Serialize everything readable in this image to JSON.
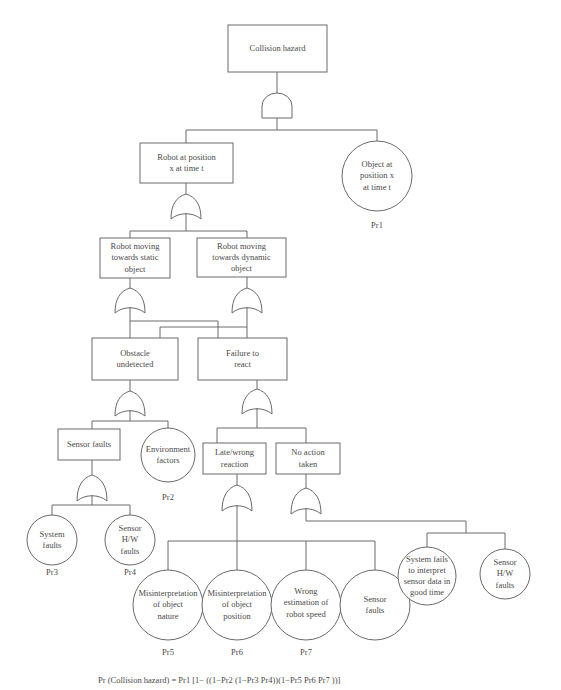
{
  "diagram": {
    "type": "fault-tree",
    "top_event": {
      "label": "Collision hazard",
      "gate": "AND"
    },
    "nodes": {
      "collision_hazard": "Collision hazard",
      "robot_at_position": [
        "Robot at position",
        "x at time t"
      ],
      "object_at_position": [
        "Object at",
        "position x",
        "at time t"
      ],
      "robot_moving_static": [
        "Robot moving",
        "towards static",
        "object"
      ],
      "robot_moving_dynamic": [
        "Robot moving",
        "towards dynamic",
        "object"
      ],
      "obstacle_undetected": [
        "Obstacle",
        "undetected"
      ],
      "failure_to_react": [
        "Failure to",
        "react"
      ],
      "sensor_faults_box": "Sensor faults",
      "environment_factors": [
        "Environment",
        "factors"
      ],
      "system_faults": [
        "System",
        "faults"
      ],
      "sensor_hw_faults_1": [
        "Sensor",
        "H/W",
        "faults"
      ],
      "late_wrong_reaction": [
        "Late/wrong",
        "reaction"
      ],
      "no_action_taken": [
        "No action",
        "taken"
      ],
      "misinterpretation_nature": [
        "Misinterpretation",
        "of object",
        "nature"
      ],
      "misinterpretation_position": [
        "Misinterpretation",
        "of object",
        "position"
      ],
      "wrong_estimation_speed": [
        "Wrong",
        "estimation of",
        "robot speed"
      ],
      "sensor_faults_circle": [
        "Sensor",
        "faults"
      ],
      "system_fails_interpret": [
        "System fails",
        "to interpret",
        "sensor data in",
        "good time"
      ],
      "sensor_hw_faults_2": [
        "Sensor",
        "H/W",
        "faults"
      ]
    },
    "probabilities": {
      "object_at_position": "Pr1",
      "environment_factors": "Pr2",
      "system_faults": "Pr3",
      "sensor_hw_faults_1": "Pr4",
      "misinterpretation_nature": "Pr5",
      "misinterpretation_position": "Pr6",
      "wrong_estimation_speed": "Pr7"
    },
    "gates": [
      {
        "under": "Collision hazard",
        "type": "AND"
      },
      {
        "under": "Robot at position x at time t",
        "type": "OR"
      },
      {
        "under": "Robot moving towards static object",
        "type": "OR"
      },
      {
        "under": "Robot moving towards dynamic object",
        "type": "OR"
      },
      {
        "under": "Obstacle undetected",
        "type": "OR"
      },
      {
        "under": "Sensor faults",
        "type": "OR"
      },
      {
        "under": "Failure to react",
        "type": "OR"
      },
      {
        "under": "Late/wrong reaction",
        "type": "OR"
      },
      {
        "under": "No action taken",
        "type": "OR"
      }
    ],
    "formula": "Pr (Collision hazard) = Pr1 [1− ((1−Pr2 (1−Pr3 Pr4))(1−Pr5 Pr6 Pr7 ))]"
  }
}
